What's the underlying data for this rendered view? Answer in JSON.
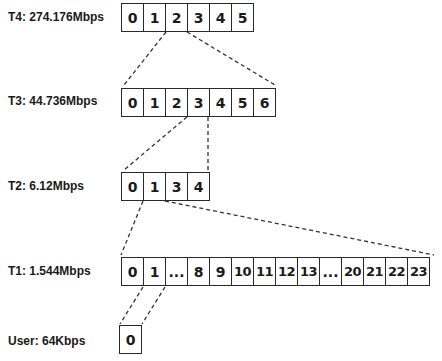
{
  "levels": [
    {
      "id": "T4",
      "label": "T4: 274.176Mbps",
      "slots": [
        "0",
        "1",
        "2",
        "3",
        "4",
        "5"
      ]
    },
    {
      "id": "T3",
      "label": "T3: 44.736Mbps",
      "slots": [
        "0",
        "1",
        "2",
        "3",
        "4",
        "5",
        "6"
      ]
    },
    {
      "id": "T2",
      "label": "T2: 6.12Mbps",
      "slots": [
        "0",
        "1",
        "3",
        "4"
      ]
    },
    {
      "id": "T1",
      "label": "T1: 1.544Mbps",
      "slots": [
        "0",
        "1",
        "...",
        "8",
        "9",
        "10",
        "11",
        "12",
        "13",
        "...",
        "20",
        "21",
        "22",
        "23"
      ]
    },
    {
      "id": "User",
      "label": "User: 64Kbps",
      "slots": [
        "0"
      ]
    }
  ],
  "expansions": [
    {
      "from": "T4",
      "slot": "2",
      "to": "T3"
    },
    {
      "from": "T3",
      "slot": "3",
      "to": "T2"
    },
    {
      "from": "T2",
      "slot": "1",
      "to": "T1"
    },
    {
      "from": "T1",
      "slot": "1",
      "to": "User"
    }
  ]
}
